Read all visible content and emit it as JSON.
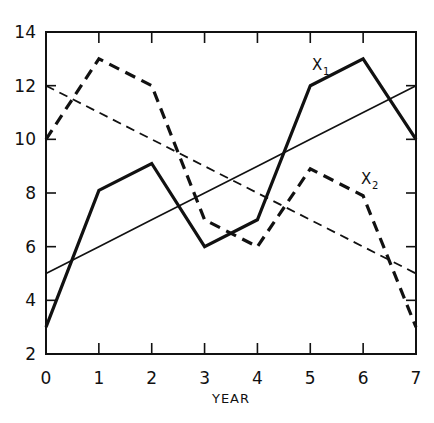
{
  "chart_data": {
    "type": "line",
    "title": "",
    "xlabel": "YEAR",
    "ylabel": "",
    "xlim": [
      0,
      7
    ],
    "ylim": [
      2,
      14
    ],
    "grid": false,
    "legend": "inline labels",
    "x": [
      0,
      1,
      2,
      3,
      4,
      5,
      6,
      7
    ],
    "x_ticks": [
      "0",
      "1",
      "2",
      "3",
      "4",
      "5",
      "6",
      "7"
    ],
    "y_ticks": [
      "2",
      "4",
      "6",
      "8",
      "10",
      "12",
      "14"
    ],
    "series": [
      {
        "name": "X1",
        "label_main": "X",
        "label_sub": "1",
        "style": "solid-thick",
        "values": [
          3,
          8.1,
          9.1,
          6,
          7,
          12,
          13,
          10
        ]
      },
      {
        "name": "X2",
        "label_main": "X",
        "label_sub": "2",
        "style": "dashed-thick",
        "values": [
          10,
          13,
          12,
          7,
          6,
          8.9,
          7.9,
          3
        ]
      },
      {
        "name": "X1 trend",
        "style": "solid-thin",
        "values": [
          5,
          6,
          7,
          8,
          9,
          10,
          11,
          12
        ]
      },
      {
        "name": "X2 trend",
        "style": "dashed-thin",
        "values": [
          12,
          11,
          10,
          9,
          8,
          7,
          6,
          5
        ]
      }
    ],
    "annotations": [
      {
        "text": "X1",
        "near": "X1 series, x≈4.9, y≈13"
      },
      {
        "text": "X2",
        "near": "X2 series, x≈5.9, y≈8.6"
      }
    ]
  },
  "colors": {
    "ink": "#111111",
    "background": "#ffffff"
  }
}
